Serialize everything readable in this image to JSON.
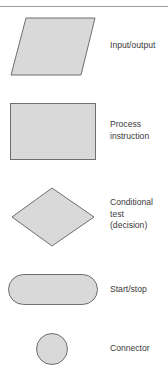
{
  "legend": {
    "items": [
      {
        "shape": "parallelogram",
        "lines": [
          "Input/output"
        ]
      },
      {
        "shape": "rectangle",
        "lines": [
          "Process",
          "instruction"
        ]
      },
      {
        "shape": "diamond",
        "lines": [
          "Conditional",
          "test",
          "(decision)"
        ]
      },
      {
        "shape": "rounded-rectangle",
        "lines": [
          "Start/stop"
        ]
      },
      {
        "shape": "circle",
        "lines": [
          "Connector"
        ]
      }
    ]
  },
  "colors": {
    "shape_fill": "#d9d9d9",
    "shape_stroke": "#6e6e6e",
    "text": "#3a3a3a",
    "rule": "#9a9a9a"
  }
}
